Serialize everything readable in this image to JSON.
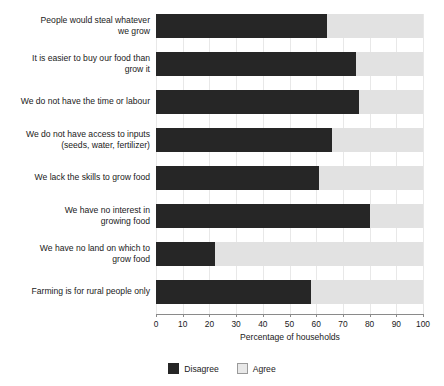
{
  "chart_data": {
    "type": "bar",
    "orientation": "horizontal",
    "stacked": true,
    "title": "",
    "xlabel": "Percentage of households",
    "ylabel": "",
    "xlim": [
      0,
      100
    ],
    "xticks": [
      0,
      10,
      20,
      30,
      40,
      50,
      60,
      70,
      80,
      90,
      100
    ],
    "grid": "vertical",
    "legend_position": "bottom-center",
    "categories": [
      "People would steal whatever we grow",
      "It is easier to buy our food than grow it",
      "We do not have the time or labour",
      "We do not have access to inputs (seeds, water, fertilizer)",
      "We lack the skills to grow food",
      "We have no interest in growing food",
      "We have no land on which to grow food",
      "Farming is for rural people only"
    ],
    "category_lines": [
      [
        "People would steal whatever",
        "we grow"
      ],
      [
        "It is easier to buy our food than",
        "grow it"
      ],
      [
        "We do not have the time or labour"
      ],
      [
        "We do not have access to inputs",
        "(seeds, water, fertilizer)"
      ],
      [
        "We lack the skills to grow food"
      ],
      [
        "We have no interest in",
        "growing food"
      ],
      [
        "We have no land on which to",
        "grow food"
      ],
      [
        "Farming is for rural people only"
      ]
    ],
    "series": [
      {
        "name": "Disagree",
        "color": "#262626",
        "values": [
          64,
          75,
          76,
          66,
          61,
          80,
          22,
          58
        ]
      },
      {
        "name": "Agree",
        "color": "#e2e2e2",
        "values": [
          36,
          25,
          24,
          34,
          39,
          20,
          78,
          42
        ]
      }
    ]
  },
  "axis": {
    "x_title": "Percentage of households",
    "x_tick_labels": [
      "0",
      "10",
      "20",
      "30",
      "40",
      "50",
      "60",
      "70",
      "80",
      "90",
      "100"
    ]
  },
  "legend": {
    "items": [
      {
        "label": "Disagree",
        "color": "#262626"
      },
      {
        "label": "Agree",
        "color": "#e8e8e8"
      }
    ]
  }
}
